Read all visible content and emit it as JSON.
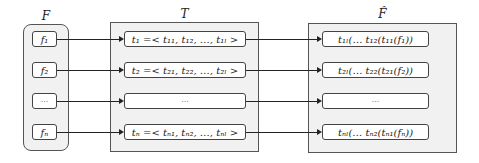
{
  "diagram": {
    "columns": {
      "F": {
        "label": "F",
        "items": [
          "f₁",
          "f₂",
          "···",
          "fₙ"
        ]
      },
      "T": {
        "label": "T",
        "items": [
          "t₁ =< t₁₁, t₁₂, …, t₁ₗ >",
          "t₂ =< t₂₁, t₂₂, …, t₂ₗ >",
          "···",
          "tₙ =< tₙ₁, tₙ₂, …, tₙₗ >"
        ]
      },
      "F_hat": {
        "label": "F̂",
        "items": [
          "t₁ₗ(… t₁₂(t₁₁(f₁))",
          "t₂ₗ(… t₂₂(t₂₁(f₂))",
          "···",
          "tₙₗ(… tₙ₂(tₙ₁(fₙ))"
        ]
      }
    },
    "edges": [
      {
        "from": "F.f1",
        "to": "T.t1"
      },
      {
        "from": "F.f2",
        "to": "T.t2"
      },
      {
        "from": "F.ellipsis",
        "to": "T.ellipsis"
      },
      {
        "from": "F.fn",
        "to": "T.tn"
      },
      {
        "from": "T.t1",
        "to": "F_hat.1"
      },
      {
        "from": "T.t2",
        "to": "F_hat.2"
      },
      {
        "from": "T.ellipsis",
        "to": "F_hat.ellipsis"
      },
      {
        "from": "T.tn",
        "to": "F_hat.n"
      }
    ]
  }
}
